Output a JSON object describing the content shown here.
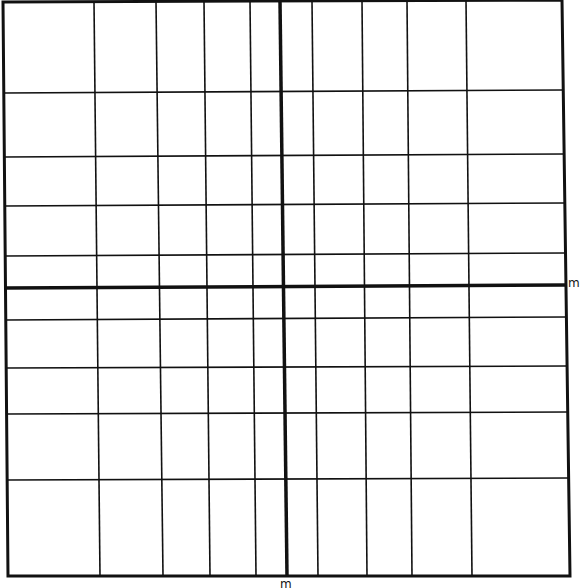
{
  "diagram": {
    "type": "hand-drawn coordinate grid",
    "line_color": "#111111",
    "background": "#ffffff",
    "border": {
      "top_left": [
        3,
        2
      ],
      "top_right": [
        562,
        0
      ],
      "bottom_right": [
        570,
        576
      ],
      "bottom_left": [
        8,
        576
      ]
    },
    "vertical_lines": [
      {
        "top_x": 94,
        "bottom_x": 100
      },
      {
        "top_x": 156,
        "bottom_x": 163
      },
      {
        "top_x": 204,
        "bottom_x": 210
      },
      {
        "top_x": 250,
        "bottom_x": 256
      },
      {
        "top_x": 312,
        "bottom_x": 318
      },
      {
        "top_x": 362,
        "bottom_x": 367
      },
      {
        "top_x": 407,
        "bottom_x": 412
      },
      {
        "top_x": 466,
        "bottom_x": 472
      }
    ],
    "horizontal_lines": [
      {
        "left_y": 93,
        "right_y": 90
      },
      {
        "left_y": 157,
        "right_y": 154
      },
      {
        "left_y": 206,
        "right_y": 203
      },
      {
        "left_y": 256,
        "right_y": 253
      },
      {
        "left_y": 320,
        "right_y": 317
      },
      {
        "left_y": 368,
        "right_y": 366
      },
      {
        "left_y": 414,
        "right_y": 412
      },
      {
        "left_y": 480,
        "right_y": 478
      }
    ],
    "x_axis": {
      "left_y": 288,
      "right_y": 285,
      "label": "m"
    },
    "y_axis": {
      "top_x": 280,
      "bottom_x": 287,
      "label": "m"
    }
  }
}
